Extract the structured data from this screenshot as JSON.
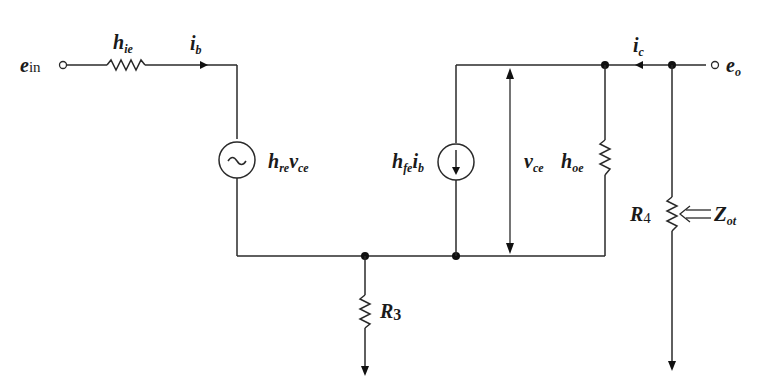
{
  "diagram": {
    "type": "h-parameter equivalent circuit",
    "labels": {
      "input_terminal": {
        "main": "e",
        "sub": "in"
      },
      "output_terminal": {
        "main": "e",
        "sub": "o"
      },
      "input_resistance": {
        "main": "h",
        "sub": "ie"
      },
      "base_current": {
        "main": "i",
        "sub": "b"
      },
      "collector_current": {
        "main": "i",
        "sub": "c"
      },
      "reverse_source": {
        "main": "h",
        "sub": "re",
        "main2": "v",
        "sub2": "ce"
      },
      "forward_source": {
        "main": "h",
        "sub": "fe",
        "main2": "i",
        "sub2": "b"
      },
      "vce": {
        "main": "v",
        "sub": "ce"
      },
      "output_conductance": {
        "main": "h",
        "sub": "oe"
      },
      "emitter_resistor": {
        "main": "R",
        "sub": "3"
      },
      "load_resistor": {
        "main": "R",
        "sub": "4"
      },
      "output_impedance": {
        "main": "Z",
        "sub": "ot"
      }
    },
    "symbols": {
      "ac_source_glyph": "~"
    }
  }
}
